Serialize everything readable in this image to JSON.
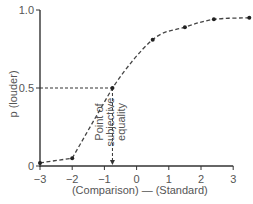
{
  "chart_data": {
    "type": "line",
    "title": "",
    "xlabel": "(Comparison) — (Standard)",
    "ylabel": "p (louder)",
    "xlim": [
      -3,
      3.5
    ],
    "ylim": [
      0,
      1.0
    ],
    "x_ticks": [
      -3,
      -2,
      -1,
      0,
      1,
      2,
      3
    ],
    "x_tick_labels": [
      "−3",
      "−2",
      "−1",
      "0",
      "1",
      "2",
      "3"
    ],
    "y_ticks": [
      0,
      0.5,
      1.0
    ],
    "y_tick_labels": [
      "0",
      "0.5",
      "1.0"
    ],
    "grid": false,
    "legend": null,
    "series": [
      {
        "name": "psychometric function",
        "style": "dashed",
        "x": [
          -3,
          -2,
          -0.75,
          0.5,
          1.5,
          2.4,
          3.5
        ],
        "y": [
          0.02,
          0.05,
          0.5,
          0.81,
          0.89,
          0.94,
          0.95
        ]
      }
    ],
    "annotations": [
      {
        "text": "Point of subjective equality",
        "lines": [
          "Point of",
          "subjective",
          "equality"
        ],
        "x": -0.75,
        "y": 0.5,
        "type": "arrow-down-to-axis"
      }
    ],
    "reference_lines": [
      {
        "type": "horizontal",
        "y": 0.5,
        "from_x": -3,
        "to_x": -0.75,
        "style": "dashed"
      },
      {
        "type": "vertical",
        "x": -0.75,
        "from_y": 0.5,
        "to_y": 0,
        "style": "dashed-arrow"
      }
    ]
  }
}
